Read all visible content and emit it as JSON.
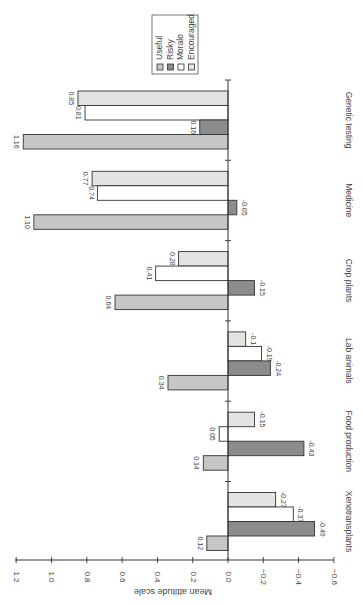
{
  "chart_data": {
    "type": "bar",
    "orientation": "rotated-90-clockwise",
    "title": "",
    "xlabel": "",
    "ylabel": "Mean attitude scale",
    "ylim": [
      -0.6,
      1.2
    ],
    "yticks": [
      "1.2",
      "1.0",
      "0.8",
      "0.6",
      "0.4",
      "0.2",
      "0.0",
      "-0.2",
      "-0.4",
      "-0.6"
    ],
    "grid": false,
    "legend_position": "upper (rotated), inside",
    "categories": [
      "Xenotransplants",
      "Food production",
      "Lab animals",
      "Crop plants",
      "Medicine",
      "Genetic testing"
    ],
    "series": [
      {
        "name": "Useful",
        "color": "#c6c6c6",
        "values": [
          0.12,
          0.14,
          0.34,
          0.64,
          1.1,
          1.16
        ],
        "labels": [
          "0.12",
          "0.14",
          "0.34",
          "0.64",
          "1.10",
          "1.16"
        ]
      },
      {
        "name": "Risky",
        "color": "#8c8c8c",
        "values": [
          -0.49,
          -0.43,
          -0.24,
          -0.15,
          -0.05,
          0.16
        ],
        "labels": [
          "-0.49",
          "-0.43",
          "-0.24",
          "-0.15",
          "-0.05",
          "0.16"
        ]
      },
      {
        "name": "Moralo",
        "color": "#ffffff",
        "values": [
          -0.37,
          0.05,
          -0.19,
          0.41,
          0.74,
          0.81
        ],
        "labels": [
          "-0.37",
          "0.05",
          "-0.19",
          "0.41",
          "0.74",
          "0.81"
        ]
      },
      {
        "name": "Encouraged",
        "color": "#e3e3e3",
        "values": [
          -0.27,
          -0.15,
          -0.1,
          0.28,
          0.77,
          0.85
        ],
        "labels": [
          "-0.27",
          "-0.15",
          "-0.1",
          "0.28",
          "0.77",
          "0.85"
        ]
      }
    ]
  },
  "legend": {
    "items": [
      {
        "label": "Useful",
        "color": "#c6c6c6"
      },
      {
        "label": "Risky",
        "color": "#8c8c8c"
      },
      {
        "label": "Moralo",
        "color": "#ffffff"
      },
      {
        "label": "Encouraged",
        "color": "#e3e3e3"
      }
    ]
  },
  "axis": {
    "label": "Mean attitude scale"
  }
}
